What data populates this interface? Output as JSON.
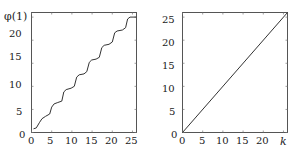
{
  "chart_data": [
    {
      "type": "line",
      "title": "",
      "ylabel": "φ(1)",
      "xlabel": "",
      "xlim": [
        0,
        26
      ],
      "ylim": [
        0,
        26
      ],
      "xticks": [
        "0",
        "5",
        "10",
        "15",
        "20",
        "25"
      ],
      "yticks": [
        "0",
        "5",
        "10",
        "15",
        "20"
      ],
      "grid": false,
      "series": [
        {
          "name": "phi(1) staircase",
          "x": [
            0.5,
            1.2,
            2.0,
            2.6,
            3.5,
            4.5,
            5.0,
            5.6,
            6.5,
            7.5,
            8.0,
            8.6,
            9.8,
            10.6,
            11.2,
            11.8,
            13.0,
            13.7,
            14.3,
            14.9,
            16.0,
            16.8,
            17.4,
            18.0,
            19.2,
            20.0,
            20.6,
            21.2,
            22.5,
            23.3,
            23.8,
            24.4,
            26.0
          ],
          "values": [
            0.8,
            1.0,
            2.2,
            3.0,
            3.5,
            4.0,
            5.5,
            6.2,
            6.5,
            6.8,
            8.8,
            9.3,
            9.6,
            10.0,
            12.0,
            12.5,
            12.7,
            13.2,
            15.2,
            15.7,
            15.9,
            16.3,
            18.4,
            18.9,
            19.1,
            19.6,
            21.6,
            22.0,
            22.2,
            22.7,
            24.6,
            25.0,
            25.0
          ]
        }
      ]
    },
    {
      "type": "line",
      "title": "",
      "xlabel": "k",
      "ylabel": "",
      "xlim": [
        0,
        26
      ],
      "ylim": [
        0,
        26
      ],
      "xticks": [
        "0",
        "5",
        "10",
        "15",
        "20"
      ],
      "yticks": [
        "0",
        "5",
        "10",
        "15",
        "20",
        "25"
      ],
      "grid": false,
      "series": [
        {
          "name": "linear",
          "x": [
            0,
            26
          ],
          "values": [
            0,
            26
          ]
        }
      ]
    }
  ],
  "left_plot": {
    "ylabel": "φ(1)",
    "xticks": [
      "0",
      "5",
      "10",
      "15",
      "20",
      "25"
    ],
    "yticks": [
      "0",
      "5",
      "10",
      "15",
      "20"
    ]
  },
  "right_plot": {
    "xlabel": "k",
    "xticks": [
      "0",
      "5",
      "10",
      "15",
      "20"
    ],
    "yticks": [
      "0",
      "5",
      "10",
      "15",
      "20",
      "25"
    ]
  }
}
